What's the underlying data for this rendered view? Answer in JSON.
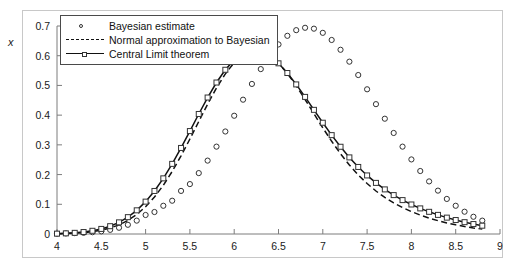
{
  "figure": {
    "ylabel": "x"
  },
  "legend": {
    "position": "top-left-inside",
    "entries": [
      {
        "label": "Bayesian estimate",
        "marker": "circle-marker",
        "style": "markers"
      },
      {
        "label": "Normal approximation to Bayesian",
        "marker": "dashed-line",
        "style": "dashed"
      },
      {
        "label": "Central Limit theorem",
        "marker": "square-marker-line",
        "style": "solid-with-markers"
      }
    ]
  },
  "chart_data": {
    "type": "line",
    "title": "",
    "xlabel": "",
    "ylabel": "x",
    "xlim": [
      4,
      9
    ],
    "ylim": [
      0,
      0.7
    ],
    "grid": false,
    "xticks": [
      4,
      4.5,
      5,
      5.5,
      6,
      6.5,
      7,
      7.5,
      8,
      8.5,
      9
    ],
    "xtick_labels": [
      "4",
      "4.5",
      "5",
      "5.5",
      "6",
      "6.5",
      "7",
      "7.5",
      "8",
      "8.5",
      "9"
    ],
    "yticks": [
      0,
      0.1,
      0.2,
      0.3,
      0.4,
      0.5,
      0.6,
      0.7
    ],
    "ytick_labels": [
      "0",
      "0.1",
      "0.2",
      "0.3",
      "0.4",
      "0.5",
      "0.6",
      "0.7"
    ],
    "x": [
      4.0,
      4.1,
      4.2,
      4.3,
      4.4,
      4.5,
      4.6,
      4.7,
      4.8,
      4.9,
      5.0,
      5.1,
      5.2,
      5.3,
      5.4,
      5.5,
      5.6,
      5.7,
      5.8,
      5.9,
      6.0,
      6.1,
      6.2,
      6.3,
      6.4,
      6.5,
      6.6,
      6.7,
      6.8,
      6.9,
      7.0,
      7.1,
      7.2,
      7.3,
      7.4,
      7.5,
      7.6,
      7.7,
      7.8,
      7.9,
      8.0,
      8.1,
      8.2,
      8.3,
      8.4,
      8.5,
      8.6,
      8.7,
      8.8
    ],
    "series": [
      {
        "name": "Bayesian estimate",
        "style": "markers",
        "marker": "circle",
        "values": [
          0.001,
          0.002,
          0.003,
          0.004,
          0.006,
          0.009,
          0.014,
          0.021,
          0.031,
          0.045,
          0.064,
          0.074,
          0.095,
          0.112,
          0.145,
          0.168,
          0.205,
          0.247,
          0.294,
          0.345,
          0.398,
          0.452,
          0.505,
          0.555,
          0.6,
          0.638,
          0.667,
          0.686,
          0.694,
          0.691,
          0.677,
          0.653,
          0.62,
          0.58,
          0.535,
          0.487,
          0.437,
          0.388,
          0.34,
          0.294,
          0.251,
          0.212,
          0.177,
          0.146,
          0.118,
          0.095,
          0.075,
          0.058,
          0.045
        ]
      },
      {
        "name": "Normal approximation to Bayesian",
        "style": "dashed",
        "values": [
          0.0008,
          0.0015,
          0.0027,
          0.0047,
          0.0079,
          0.0128,
          0.0202,
          0.0308,
          0.0456,
          0.0656,
          0.0916,
          0.1243,
          0.164,
          0.2105,
          0.2629,
          0.3197,
          0.3786,
          0.4369,
          0.4914,
          0.539,
          0.5769,
          0.6029,
          0.6157,
          0.6148,
          0.6009,
          0.5755,
          0.5406,
          0.4988,
          0.4527,
          0.4048,
          0.3573,
          0.312,
          0.2701,
          0.2323,
          0.1989,
          0.1698,
          0.1446,
          0.1231,
          0.1047,
          0.0889,
          0.0754,
          0.0637,
          0.0536,
          0.0449,
          0.0373,
          0.0308,
          0.0252,
          0.0204,
          0.0164
        ]
      },
      {
        "name": "Central Limit theorem",
        "style": "solid-with-markers",
        "marker": "square",
        "values": [
          0.0012,
          0.0022,
          0.0039,
          0.0066,
          0.0108,
          0.0171,
          0.0263,
          0.0392,
          0.0567,
          0.0797,
          0.1089,
          0.1448,
          0.1873,
          0.236,
          0.2896,
          0.3464,
          0.4039,
          0.4593,
          0.5098,
          0.5527,
          0.5858,
          0.6074,
          0.6167,
          0.6136,
          0.599,
          0.5744,
          0.5418,
          0.5034,
          0.4614,
          0.4178,
          0.3745,
          0.3327,
          0.2936,
          0.2578,
          0.2256,
          0.1971,
          0.172,
          0.1501,
          0.1309,
          0.1141,
          0.0993,
          0.0862,
          0.0746,
          0.0643,
          0.0551,
          0.047,
          0.0398,
          0.0335,
          0.028
        ]
      }
    ]
  }
}
